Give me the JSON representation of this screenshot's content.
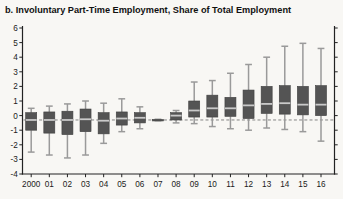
{
  "title": "b. Involuntary Part-Time Employment, Share of Total Employment",
  "colors": {
    "background": "#f8f7f4",
    "title": "#111111",
    "axis": "#222222",
    "tick_label": "#1a1a1a",
    "box_fill": "#545454",
    "box_stroke": "#3e3e3e",
    "median_line": "#c9c9c9",
    "whisker": "#9a9a9a",
    "reference_dashed": "#858585"
  },
  "chart_data": {
    "type": "boxplot",
    "title": "b. Involuntary Part-Time Employment, Share of Total Employment",
    "xlabel": "",
    "ylabel": "",
    "ylim": [
      -4,
      6
    ],
    "ytick_interval": 1,
    "ytick_labels": [
      "-4",
      "-3",
      "-2",
      "-1",
      "0",
      "1",
      "2",
      "3",
      "4",
      "5",
      "6"
    ],
    "grid": false,
    "legend": false,
    "reference_line": -0.3,
    "reference_line_style": "dashed",
    "categories": [
      "2000",
      "01",
      "02",
      "03",
      "04",
      "05",
      "06",
      "07",
      "08",
      "09",
      "10",
      "11",
      "12",
      "13",
      "14",
      "15",
      "16"
    ],
    "boxes": [
      {
        "category": "2000",
        "low": -2.5,
        "q1": -1.0,
        "median": -0.3,
        "q3": 0.2,
        "high": 0.5
      },
      {
        "category": "01",
        "low": -2.7,
        "q1": -1.2,
        "median": -0.3,
        "q3": 0.25,
        "high": 0.65
      },
      {
        "category": "02",
        "low": -2.9,
        "q1": -1.3,
        "median": -0.3,
        "q3": 0.3,
        "high": 0.8
      },
      {
        "category": "03",
        "low": -2.7,
        "q1": -1.1,
        "median": -0.25,
        "q3": 0.45,
        "high": 1.0
      },
      {
        "category": "04",
        "low": -1.9,
        "q1": -1.25,
        "median": -0.35,
        "q3": 0.2,
        "high": 0.85
      },
      {
        "category": "05",
        "low": -1.1,
        "q1": -0.65,
        "median": -0.2,
        "q3": 0.25,
        "high": 1.15
      },
      {
        "category": "06",
        "low": -0.9,
        "q1": -0.5,
        "median": -0.15,
        "q3": 0.2,
        "high": 0.6
      },
      {
        "category": "07",
        "low": -0.35,
        "q1": -0.33,
        "median": -0.3,
        "q3": -0.27,
        "high": -0.25
      },
      {
        "category": "08",
        "low": -0.5,
        "q1": -0.3,
        "median": 0.0,
        "q3": 0.2,
        "high": 0.35
      },
      {
        "category": "09",
        "low": -0.55,
        "q1": -0.1,
        "median": 0.35,
        "q3": 1.0,
        "high": 2.3
      },
      {
        "category": "10",
        "low": -0.75,
        "q1": -0.1,
        "median": 0.5,
        "q3": 1.4,
        "high": 2.4
      },
      {
        "category": "11",
        "low": -0.9,
        "q1": -0.05,
        "median": 0.5,
        "q3": 1.25,
        "high": 2.9
      },
      {
        "category": "12",
        "low": -1.0,
        "q1": -0.2,
        "median": 0.7,
        "q3": 1.75,
        "high": 3.5
      },
      {
        "category": "13",
        "low": -0.85,
        "q1": 0.15,
        "median": 0.8,
        "q3": 2.0,
        "high": 4.0
      },
      {
        "category": "14",
        "low": -0.95,
        "q1": 0.1,
        "median": 0.85,
        "q3": 2.05,
        "high": 4.75
      },
      {
        "category": "15",
        "low": -1.1,
        "q1": 0.05,
        "median": 0.75,
        "q3": 2.0,
        "high": 4.95
      },
      {
        "category": "16",
        "low": -1.75,
        "q1": 0.0,
        "median": 0.75,
        "q3": 2.05,
        "high": 4.6
      }
    ]
  }
}
